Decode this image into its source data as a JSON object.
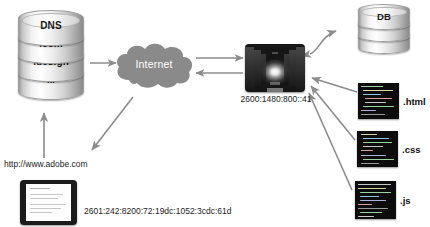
{
  "diagram": {
    "background_color": "#ffffff",
    "arrow_color": "#8c8c8c"
  },
  "dns": {
    "name": "dns-database",
    "segments": [
      {
        "label": "DNS"
      },
      {
        "label": ".com"
      },
      {
        "label": ".design"
      },
      {
        "label": "..."
      }
    ]
  },
  "internet": {
    "label": "Internet",
    "fill_color": "#8a8a8a",
    "text_color": "#ffffff"
  },
  "server": {
    "label_ip": "2600:1480:800::41",
    "alt": "data center corridor"
  },
  "db": {
    "name": "db-database",
    "segments": [
      {
        "label": "DB"
      },
      {
        "label": ""
      },
      {
        "label": ""
      }
    ]
  },
  "files": [
    {
      "ext": ".html",
      "name": "html-file"
    },
    {
      "ext": ".css",
      "name": "css-file"
    },
    {
      "ext": ".js",
      "name": "js-file"
    }
  ],
  "client": {
    "url": "http://www.adobe.com",
    "ip": "2601:242:8200:72:19dc:1052:3cdc:61d",
    "device": "tablet"
  }
}
